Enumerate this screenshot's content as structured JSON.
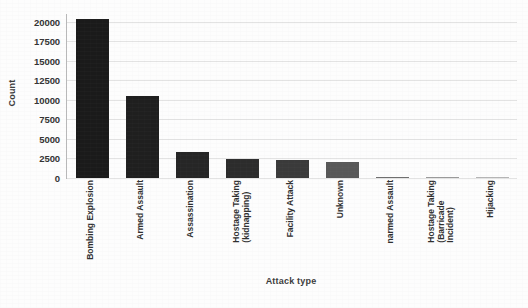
{
  "chart_data": {
    "type": "bar",
    "title": "",
    "xlabel": "Attack type",
    "ylabel": "Count",
    "ylim": [
      0,
      21000
    ],
    "yticks": [
      0,
      2500,
      5000,
      7500,
      10000,
      12500,
      15000,
      17500,
      20000
    ],
    "ytick_labels": [
      "0",
      "2500",
      "5000",
      "7500",
      "10000",
      "12500",
      "15000",
      "17500",
      "20000"
    ],
    "grid": true,
    "legend": "none",
    "bar_color": "#1c1c1c",
    "categories": [
      "Bombing Explosion",
      "Armed Assault",
      "Assassination",
      "Hostage Taking (kidnapping)",
      "Facility Attack",
      "Unknown",
      "narmed Assault",
      "Hostage Taking (Barricade Incident)",
      "Hijacking"
    ],
    "category_lines": [
      [
        "Bombing Explosion"
      ],
      [
        "Armed Assault"
      ],
      [
        "Assassination"
      ],
      [
        "Hostage Taking",
        "(kidnapping)"
      ],
      [
        "Facility Attack"
      ],
      [
        "Unknown"
      ],
      [
        "narmed Assault"
      ],
      [
        "Hostage Taking",
        "(Barricade",
        "Incident)"
      ],
      [
        "Hijacking"
      ]
    ],
    "values": [
      20400,
      10500,
      3300,
      2400,
      2350,
      2000,
      160,
      60,
      30
    ],
    "bar_shades": [
      "#1a1a1a",
      "#1f1f1f",
      "#262626",
      "#2c2c2c",
      "#3a3a3a",
      "#585858",
      "#6f6f6f",
      "#9a9a9a",
      "#b5b5b5"
    ]
  }
}
